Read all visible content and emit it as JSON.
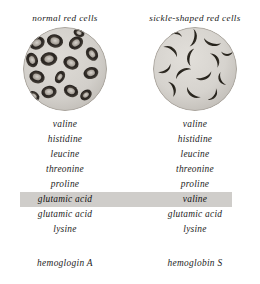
{
  "figure": {
    "background_color": "#ffffff",
    "highlight_color": "#cfcdca",
    "text_color": "#1c1c1c"
  },
  "columns": [
    {
      "header": "normal red cells",
      "caption": "hemoglogin A",
      "micrograph": "normal-red-cells-micrograph",
      "sequence": [
        "valine",
        "histidine",
        "leucine",
        "threonine",
        "proline",
        "glutamic acid",
        "glutamic acid",
        "lysine"
      ]
    },
    {
      "header": "sickle-shaped red cells",
      "caption": "hemoglobin S",
      "micrograph": "sickle-shaped-red-cells-micrograph",
      "sequence": [
        "valine",
        "histidine",
        "leucine",
        "threonine",
        "proline",
        "valine",
        "glutamic acid",
        "lysine"
      ]
    }
  ],
  "highlighted_row_index": 5
}
